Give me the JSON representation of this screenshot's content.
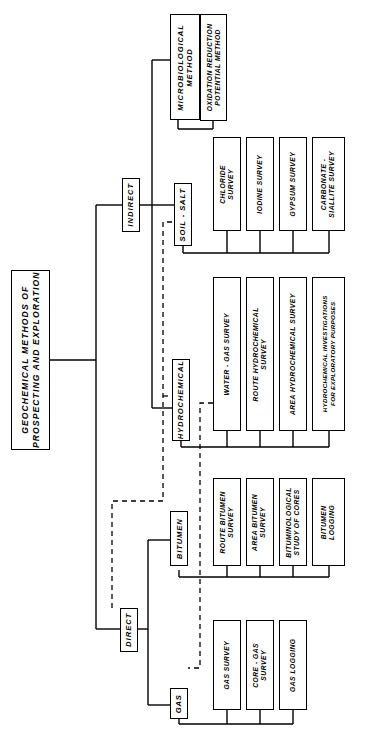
{
  "diagram": {
    "type": "tree",
    "orientation": "horizontal-rotated-labels",
    "line_styles": {
      "solid": "hierarchy link",
      "dashed": "cross-reference link"
    },
    "colors": {
      "line": "#000000",
      "box_fill": "#ffffff",
      "text": "#000000"
    }
  },
  "root": {
    "label": "GEOCHEMICAL METHODS OF PROSPECTING AND EXPLORATION",
    "line1": "GEOCHEMICAL  METHODS  OF",
    "line2": "PROSPECTING AND EXPLORATION"
  },
  "level2": [
    {
      "id": "indirect",
      "label": "INDIRECT"
    },
    {
      "id": "direct",
      "label": "DIRECT"
    }
  ],
  "level3": [
    {
      "id": "microbiological",
      "label": "MICROBIOLOGICAL METHOD",
      "line1": "MICROBIOLOGICAL",
      "line2": "METHOD",
      "parent": "indirect"
    },
    {
      "id": "soil_salt",
      "label": "SOIL - SALT",
      "parent": "indirect"
    },
    {
      "id": "hydrochemical",
      "label": "HYDROCHEMICAL",
      "parent": "indirect"
    },
    {
      "id": "bitumen",
      "label": "BITUMEN",
      "parent": "direct"
    },
    {
      "id": "gas",
      "label": "GAS",
      "parent": "direct"
    }
  ],
  "leaves": {
    "microbiological": [
      {
        "label": "OXIDATION REDUCTION POTENTIAL METHOD",
        "line1": "OXIDATION  REDUCTION",
        "line2": "POTENTIAL  METHOD"
      }
    ],
    "soil_salt": [
      {
        "label": "CHLORIDE SURVEY",
        "line1": "CHLORIDE",
        "line2": "SURVEY"
      },
      {
        "label": "IODINE SURVEY",
        "line1": "IODINE  SURVEY",
        "line2": ""
      },
      {
        "label": "GYPSUM SURVEY",
        "line1": "GYPSUM  SURVEY",
        "line2": ""
      },
      {
        "label": "CARBONATE - SIALLITE SURVEY",
        "line1": "CARBONATE -",
        "line2": "SIALLITE  SURVEY"
      }
    ],
    "hydrochemical": [
      {
        "label": "WATER - GAS SURVEY",
        "line1": "WATER - GAS  SURVEY",
        "line2": ""
      },
      {
        "label": "ROUTE HYDROCHEMICAL SURVEY",
        "line1": "ROUTE  HYDROCHEMICAL",
        "line2": "SURVEY"
      },
      {
        "label": "AREA HYDROCHEMICAL SURVEY",
        "line1": "AREA  HYDROCHEMICAL  SURVEY",
        "line2": ""
      },
      {
        "label": "HYDROCHEMICAL INVESTIGATIONS FOR EXPLORATORY PURPOSES",
        "line1": "HYDROCHEMICAL  INVESTIGATIONS",
        "line2": "FOR  EXPLORATORY  PURPOSES"
      }
    ],
    "bitumen": [
      {
        "label": "ROUTE BITUMEN SURVEY",
        "line1": "ROUTE  BITUMEN",
        "line2": "SURVEY"
      },
      {
        "label": "AREA BITUMEN SURVEY",
        "line1": "AREA  BITUMEN",
        "line2": "SURVEY"
      },
      {
        "label": "BITUMINOLOGICAL STUDY OF CORES",
        "line1": "BITUMINOLOGICAL",
        "line2": "STUDY  OF  CORES"
      },
      {
        "label": "BITUMEN LOGGING",
        "line1": "BITUMEN",
        "line2": "LOGGING"
      }
    ],
    "gas": [
      {
        "label": "GAS SURVEY",
        "line1": "GAS  SURVEY",
        "line2": ""
      },
      {
        "label": "CORE - GAS SURVEY",
        "line1": "CORE - GAS",
        "line2": "SURVEY"
      },
      {
        "label": "GAS LOGGING",
        "line1": "GAS  LOGGING",
        "line2": ""
      }
    ]
  }
}
